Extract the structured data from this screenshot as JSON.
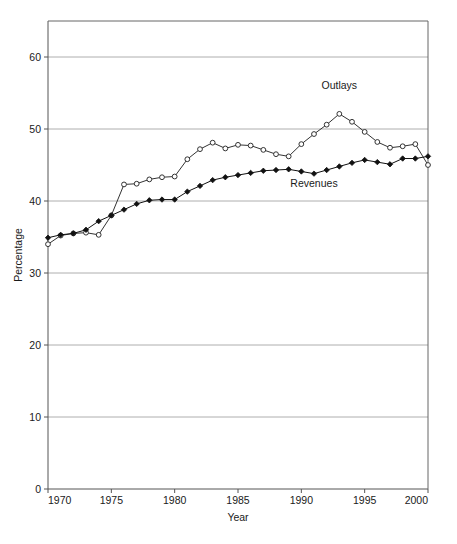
{
  "chart_data": {
    "type": "line",
    "title": "",
    "xlabel": "Year",
    "ylabel": "Percentage",
    "xlim": [
      1970,
      2000
    ],
    "ylim": [
      0,
      65
    ],
    "grid": true,
    "legend_position": "inline-annotation",
    "y_ticks": [
      0,
      10,
      20,
      30,
      40,
      50,
      60
    ],
    "y_tick_labels": [
      "0",
      "10",
      "20",
      "30",
      "40",
      "50",
      "60"
    ],
    "x_ticks": [
      1970,
      1975,
      1980,
      1985,
      1990,
      1995,
      2000
    ],
    "x_tick_labels": [
      "1970",
      "1975",
      "1980",
      "1985",
      "1990",
      "1995",
      "2000"
    ],
    "x": [
      1970,
      1971,
      1972,
      1973,
      1974,
      1975,
      1976,
      1977,
      1978,
      1979,
      1980,
      1981,
      1982,
      1983,
      1984,
      1985,
      1986,
      1987,
      1988,
      1989,
      1990,
      1991,
      1992,
      1993,
      1994,
      1995,
      1996,
      1997,
      1998,
      1999,
      2000
    ],
    "series": [
      {
        "name": "Outlays",
        "marker": "open-circle",
        "color": "#333333",
        "values": [
          34.0,
          35.2,
          35.5,
          35.6,
          35.3,
          38.0,
          42.3,
          42.4,
          43.0,
          43.3,
          43.4,
          45.8,
          47.2,
          48.1,
          47.3,
          47.8,
          47.7,
          47.1,
          46.5,
          46.2,
          47.9,
          49.3,
          50.6,
          52.1,
          51.0,
          49.6,
          48.2,
          47.4,
          47.6,
          47.9,
          45.0
        ]
      },
      {
        "name": "Revenues",
        "marker": "filled-diamond",
        "color": "#111111",
        "values": [
          34.9,
          35.3,
          35.5,
          36.0,
          37.2,
          38.0,
          38.8,
          39.6,
          40.1,
          40.2,
          40.2,
          41.3,
          42.1,
          42.9,
          43.3,
          43.6,
          43.9,
          44.2,
          44.3,
          44.4,
          44.1,
          43.8,
          44.3,
          44.8,
          45.3,
          45.7,
          45.4,
          45.1,
          45.9,
          45.9,
          46.2
        ]
      }
    ],
    "annotations": [
      {
        "text": "Outlays",
        "x": 1993,
        "y": 55.5
      },
      {
        "text": "Revenues",
        "x": 1991,
        "y": 42.0
      }
    ]
  }
}
